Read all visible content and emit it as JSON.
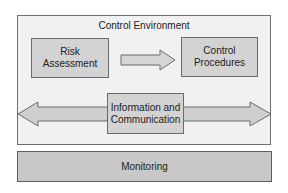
{
  "diagram": {
    "container": {
      "label": "Control Environment"
    },
    "nodes": [
      {
        "id": "risk",
        "label": "Risk\nAssessment"
      },
      {
        "id": "control",
        "label": "Control\nProcedures"
      },
      {
        "id": "info",
        "label": "Information and\nCommunication"
      },
      {
        "id": "monitoring",
        "label": "Monitoring"
      }
    ],
    "edges": [
      {
        "from": "risk",
        "to": "control",
        "type": "single-arrow"
      },
      {
        "from": "info",
        "to": "container-left-edge",
        "type": "double-arrow"
      }
    ],
    "colors": {
      "container_fill": "#f1f1f1",
      "box_fill": "#d3d3d3",
      "monitoring_fill": "#c8c8c8",
      "border": "#6a6a6a"
    }
  }
}
